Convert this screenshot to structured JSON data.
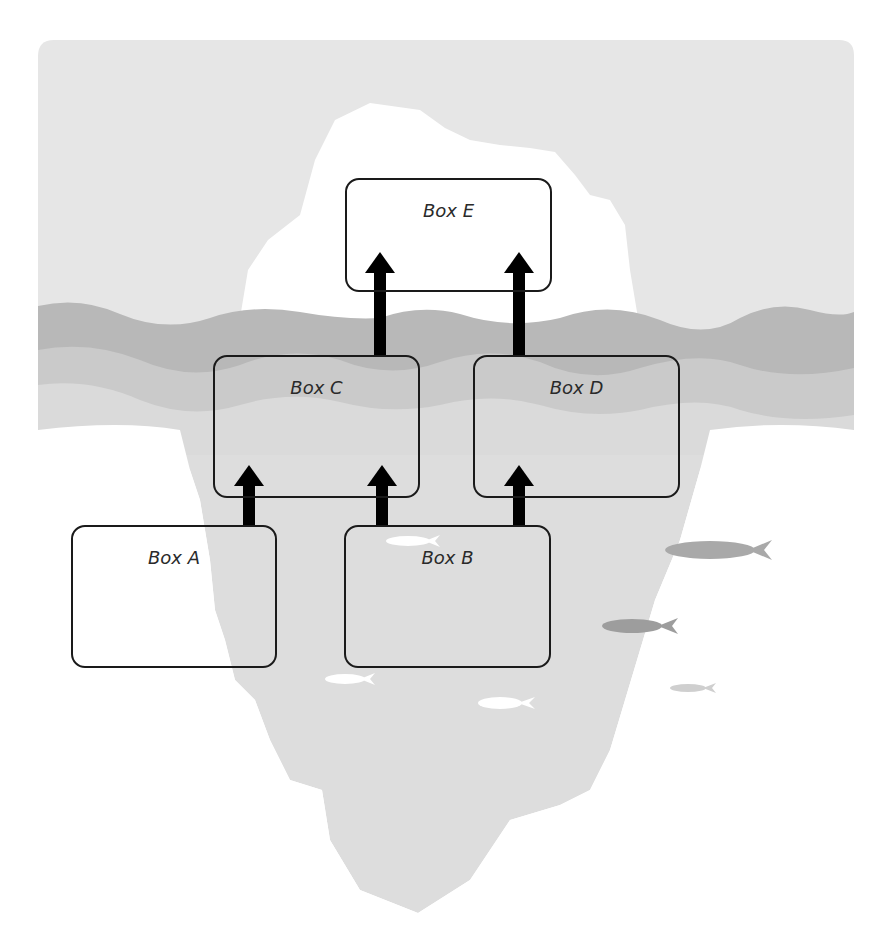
{
  "diagram": {
    "theme": "iceberg",
    "colors": {
      "sky": "#e6e6e6",
      "wave_dark": "#b5b5b5",
      "wave_mid": "#c9c9c9",
      "wave_light": "#d9d9d9",
      "iceberg_above": "#ffffff",
      "iceberg_below": "#dddddd",
      "box_border": "#1a1a1a",
      "arrow": "#000000"
    },
    "boxes": [
      {
        "id": "A",
        "label": "Box A",
        "x": 71,
        "y": 525,
        "w": 206,
        "h": 143
      },
      {
        "id": "B",
        "label": "Box B",
        "x": 344,
        "y": 525,
        "w": 207,
        "h": 143
      },
      {
        "id": "C",
        "label": "Box C",
        "x": 213,
        "y": 355,
        "w": 207,
        "h": 143
      },
      {
        "id": "D",
        "label": "Box D",
        "x": 473,
        "y": 355,
        "w": 207,
        "h": 143
      },
      {
        "id": "E",
        "label": "Box E",
        "x": 345,
        "y": 178,
        "w": 207,
        "h": 114
      }
    ],
    "arrows": [
      {
        "from": "A",
        "to": "C"
      },
      {
        "from": "B",
        "to": "C"
      },
      {
        "from": "B",
        "to": "D"
      },
      {
        "from": "C",
        "to": "E"
      },
      {
        "from": "D",
        "to": "E"
      }
    ]
  }
}
